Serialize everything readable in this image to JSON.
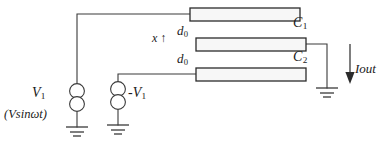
{
  "figure": {
    "colors": {
      "line": "#3a3a3a",
      "plate_border": "#2b2b2b",
      "plate_fill": "#f7f7f7",
      "text": "#1a1a1a",
      "background": "#ffffff"
    }
  },
  "labels": {
    "v1": "V",
    "v1_sub": "1",
    "vsource_expression": "(Vsinωt)",
    "neg_v1": "-V",
    "neg_v1_sub": "1",
    "displacement": "x",
    "displacement_arrow": "↑",
    "gap_top": "d",
    "gap_top_sub": "0",
    "gap_bottom": "d",
    "gap_bottom_sub": "0",
    "c1": "C",
    "c1_sub": "1",
    "c2": "C",
    "c2_sub": "2",
    "iout": "Iout"
  },
  "components": {
    "plates": [
      {
        "name": "top-plate",
        "x": 190,
        "y": 8,
        "width": 110,
        "height": 13
      },
      {
        "name": "middle-plate",
        "x": 196,
        "y": 38,
        "width": 110,
        "height": 13
      },
      {
        "name": "bottom-plate",
        "x": 196,
        "y": 68,
        "width": 110,
        "height": 13
      }
    ],
    "sources": [
      {
        "name": "source-v1",
        "cx": 77,
        "cy": 98
      },
      {
        "name": "source-neg-v1",
        "cx": 118,
        "cy": 96
      }
    ],
    "grounds": [
      {
        "name": "ground-v1",
        "x": 77,
        "y": 127
      },
      {
        "name": "ground-neg-v1",
        "x": 118,
        "y": 125
      },
      {
        "name": "ground-output",
        "x": 327,
        "y": 88
      }
    ],
    "current_arrow": {
      "name": "iout-arrow",
      "x": 350,
      "y1": 44,
      "y2": 82
    }
  }
}
